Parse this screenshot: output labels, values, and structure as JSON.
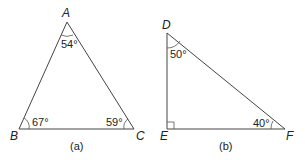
{
  "figure": {
    "triangle_a": {
      "caption": "(a)",
      "vertices": {
        "A": "A",
        "B": "B",
        "C": "C"
      },
      "angles": {
        "A": "54°",
        "B": "67°",
        "C": "59°"
      }
    },
    "triangle_b": {
      "caption": "(b)",
      "vertices": {
        "D": "D",
        "E": "E",
        "F": "F"
      },
      "angles": {
        "D": "50°",
        "F": "40°",
        "E": "right-angle"
      }
    }
  }
}
